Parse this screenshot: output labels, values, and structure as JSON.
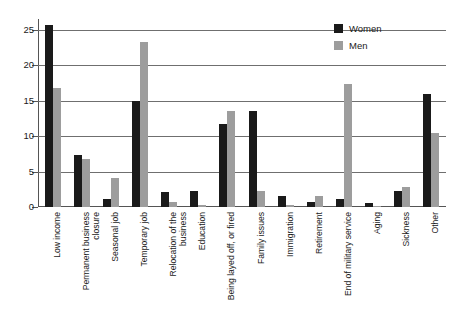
{
  "chart_data": {
    "type": "bar",
    "title": "",
    "subtitle": "",
    "xlabel": "",
    "ylabel": "",
    "ylim": [
      0,
      26.5
    ],
    "yticks": [
      0,
      5,
      10,
      15,
      20,
      25
    ],
    "grid": true,
    "legend_position": "top-right",
    "categories": [
      "Low income",
      "Permanent business closure",
      "Seasonal job",
      "Temporary job",
      "Relocation of the business",
      "Education",
      "Being layed off, or fired",
      "Family issues",
      "Immigration",
      "Retirement",
      "End of military service",
      "Aging",
      "Sickness",
      "Other"
    ],
    "category_lines": [
      [
        "Low income"
      ],
      [
        "Permanent business",
        "closure"
      ],
      [
        "Seasonal job"
      ],
      [
        "Temporary job"
      ],
      [
        "Relocation of the",
        "business"
      ],
      [
        "Education"
      ],
      [
        "Being layed off, or fired"
      ],
      [
        "Family issues"
      ],
      [
        "Immigration"
      ],
      [
        "Retirement"
      ],
      [
        "End of military service"
      ],
      [
        "Aging"
      ],
      [
        "Sickness"
      ],
      [
        "Other"
      ]
    ],
    "series": [
      {
        "name": "Women",
        "color": "#1a1a1a",
        "values": [
          25.6,
          7.4,
          1.2,
          14.9,
          2.1,
          2.3,
          11.7,
          13.5,
          1.5,
          0.7,
          1.1,
          0.6,
          2.3,
          15.9
        ]
      },
      {
        "name": "Men",
        "color": "#9d9d9d",
        "values": [
          16.8,
          6.7,
          4.1,
          23.2,
          0.7,
          0.3,
          13.6,
          2.3,
          0.3,
          1.5,
          17.3,
          0.05,
          2.8,
          10.5
        ]
      }
    ]
  },
  "legend": {
    "items": [
      {
        "label": "Women",
        "color": "#1a1a1a"
      },
      {
        "label": "Men",
        "color": "#9d9d9d"
      }
    ]
  },
  "axis": {
    "y_tick_labels": [
      "0",
      "5",
      "10",
      "15",
      "20",
      "25"
    ]
  },
  "colors": {
    "women": "#1a1a1a",
    "men": "#9d9d9d",
    "grid": "#6f6f6f",
    "axis": "#555555",
    "background": "#ffffff"
  }
}
